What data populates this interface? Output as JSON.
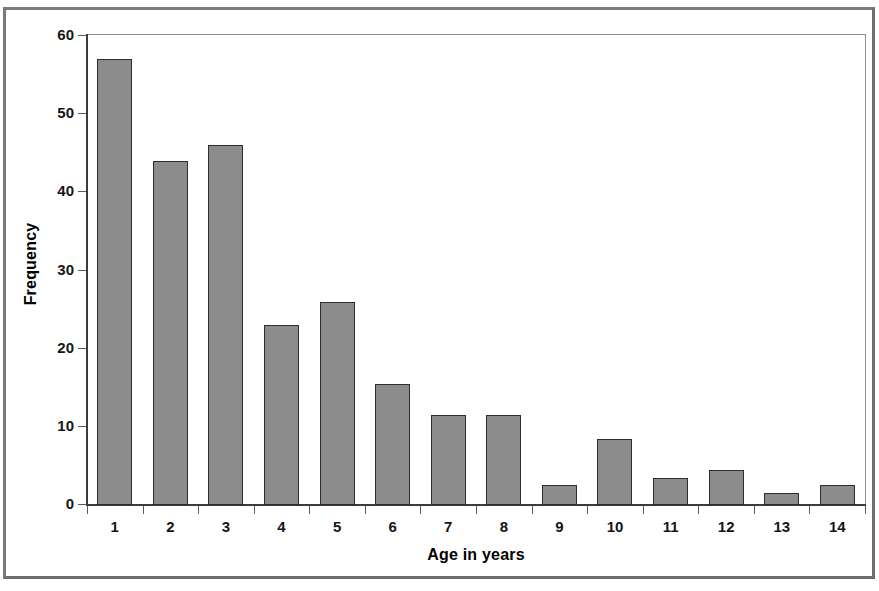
{
  "figure": {
    "x_axis_title": "Age in years",
    "y_axis_title": "Frequency"
  },
  "chart_data": {
    "type": "bar",
    "title": "",
    "subtitle": "",
    "xlabel": "Age in years",
    "ylabel": "Frequency",
    "categories": [
      "1",
      "2",
      "3",
      "4",
      "5",
      "6",
      "7",
      "8",
      "9",
      "10",
      "11",
      "12",
      "13",
      "14"
    ],
    "values": [
      57,
      44,
      46,
      23,
      26,
      15.5,
      11.5,
      11.5,
      2.5,
      8.5,
      3.5,
      4.5,
      1.5,
      2.5
    ],
    "ylim": [
      0,
      60
    ],
    "ytick_values": [
      0,
      10,
      20,
      30,
      40,
      50,
      60
    ],
    "ytick_labels": [
      "0",
      "10",
      "20",
      "30",
      "40",
      "50",
      "60"
    ],
    "grid": false,
    "legend": null,
    "bar_color": "#8c8c8c",
    "bar_edge_color": "#2e2e2e",
    "annotations": []
  }
}
